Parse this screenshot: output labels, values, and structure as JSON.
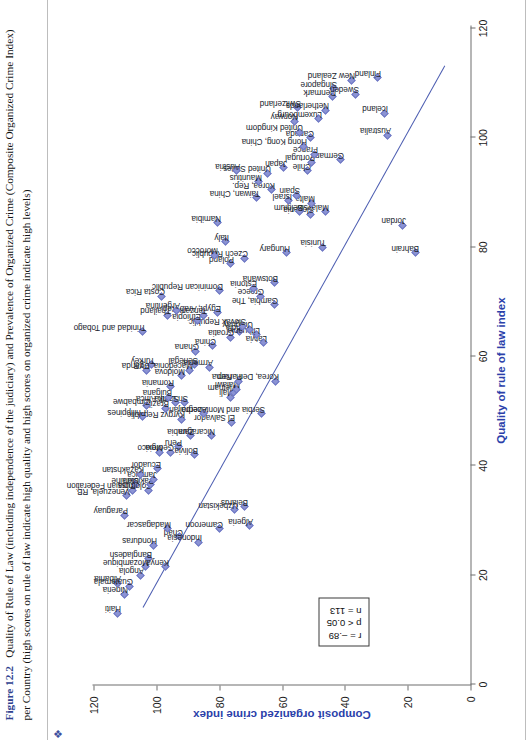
{
  "figure": {
    "bullet_icon": "diamond-bullet",
    "label": "Figure 12.2",
    "caption": "Quality of Rule of Law (including independence of the judiciary) and Prevalence of Organized Crime (Composite Organized Crime Index) per Country (high scores on rule of law indicate high quality and high scores on organized crime indicate high levels)"
  },
  "stats": {
    "r": "r = –.89",
    "p": "p < 0.05",
    "n": "n = 113"
  },
  "colors": {
    "accent_label": "#2e3f8f",
    "axis_title": "#2b3faa",
    "marker_fill": "#8b93d4",
    "marker_edge": "#6f78c4",
    "fit_line": "#4a5bb0",
    "axis_line": "#6f6f6f"
  },
  "chart_data": {
    "type": "scatter",
    "title": "Quality of Rule of Law (including independence of the judiciary) and Prevalence of Organized Crime (Composite Organized Crime Index) per Country",
    "xlabel": "Quality of rule of law index",
    "ylabel": "Composit organized crime index",
    "xlim": [
      0,
      120
    ],
    "ylim": [
      0,
      120
    ],
    "xticks": [
      0,
      20,
      40,
      60,
      80,
      100,
      120
    ],
    "yticks": [
      0,
      20,
      40,
      60,
      80,
      100,
      120
    ],
    "grid": false,
    "legend": "none",
    "annotations": [
      "r = –.89",
      "p < 0.05",
      "n = 113"
    ],
    "trendline": {
      "x0": 14,
      "y0": 104.5,
      "x1": 113,
      "y1": 8.5,
      "note": "negative linear fit"
    },
    "point_label_key": "country",
    "points": [
      {
        "country": "Haiti",
        "x": 13.0,
        "y": 112.5
      },
      {
        "country": "Nigeria",
        "x": 16.5,
        "y": 110.0
      },
      {
        "country": "Albania",
        "x": 18.5,
        "y": 112.5
      },
      {
        "country": "Guatemala",
        "x": 18.0,
        "y": 108.5
      },
      {
        "country": "Angola",
        "x": 20.0,
        "y": 105.0
      },
      {
        "country": "Mozambique",
        "x": 21.5,
        "y": 103.5
      },
      {
        "country": "Bangladesh",
        "x": 23.0,
        "y": 102.5
      },
      {
        "country": "Honduras",
        "x": 25.5,
        "y": 101.0
      },
      {
        "country": "Kenya",
        "x": 21.5,
        "y": 97.0
      },
      {
        "country": "Chad",
        "x": 27.0,
        "y": 92.5
      },
      {
        "country": "Madagascar",
        "x": 28.5,
        "y": 96.5
      },
      {
        "country": "Indonesia",
        "x": 26.0,
        "y": 86.5
      },
      {
        "country": "Cameroon",
        "x": 28.5,
        "y": 80.0
      },
      {
        "country": "Algeria",
        "x": 29.0,
        "y": 70.5
      },
      {
        "country": "Uzbekistan",
        "x": 32.0,
        "y": 75.0
      },
      {
        "country": "Belarus",
        "x": 32.5,
        "y": 72.0
      },
      {
        "country": "Paraguay",
        "x": 31.0,
        "y": 110.0
      },
      {
        "country": "Venezuela, RB",
        "x": 34.5,
        "y": 109.5
      },
      {
        "country": "Russian Federation",
        "x": 35.5,
        "y": 107.5
      },
      {
        "country": "Ukraine",
        "x": 36.5,
        "y": 106.5
      },
      {
        "country": "Colombia",
        "x": 35.5,
        "y": 102.5
      },
      {
        "country": "Pakistan",
        "x": 36.5,
        "y": 102.0
      },
      {
        "country": "Jamaica",
        "x": 37.5,
        "y": 101.0
      },
      {
        "country": "Kazakhstan",
        "x": 38.5,
        "y": 105.0
      },
      {
        "country": "Ecuador",
        "x": 39.5,
        "y": 99.5
      },
      {
        "country": "Mexico",
        "x": 42.5,
        "y": 99.0
      },
      {
        "country": "Georgia",
        "x": 42.5,
        "y": 95.5
      },
      {
        "country": "Peru",
        "x": 43.5,
        "y": 93.0
      },
      {
        "country": "Bolivia",
        "x": 42.0,
        "y": 88.0
      },
      {
        "country": "Zambia",
        "x": 45.5,
        "y": 89.0
      },
      {
        "country": "Nicaragua",
        "x": 45.5,
        "y": 82.5
      },
      {
        "country": "El Salvador",
        "x": 48.0,
        "y": 76.0
      },
      {
        "country": "Serbia and Montenegro",
        "x": 49.5,
        "y": 66.5
      },
      {
        "country": "Korea, Dem. Rep.",
        "x": 55.5,
        "y": 62.0
      },
      {
        "country": "Mali",
        "x": 52.5,
        "y": 76.5
      },
      {
        "country": "Vietnam",
        "x": 53.5,
        "y": 75.5
      },
      {
        "country": "Malawi",
        "x": 54.0,
        "y": 74.5
      },
      {
        "country": "Panama",
        "x": 55.5,
        "y": 74.0
      },
      {
        "country": "Kyrgyz Republic",
        "x": 48.5,
        "y": 92.0
      },
      {
        "country": "Azerbaijan",
        "x": 49.5,
        "y": 85.0
      },
      {
        "country": "Sri Lanka",
        "x": 51.5,
        "y": 91.0
      },
      {
        "country": "South Africa",
        "x": 51.5,
        "y": 94.0
      },
      {
        "country": "Brazil",
        "x": 50.5,
        "y": 97.0
      },
      {
        "country": "Bulgaria",
        "x": 52.5,
        "y": 96.0
      },
      {
        "country": "Romania",
        "x": 54.5,
        "y": 95.5
      },
      {
        "country": "Zimbabwe",
        "x": 51.0,
        "y": 103.0
      },
      {
        "country": "Philippines",
        "x": 49.0,
        "y": 104.5
      },
      {
        "country": "Uganda",
        "x": 57.5,
        "y": 103.0
      },
      {
        "country": "Turkey",
        "x": 58.5,
        "y": 101.5
      },
      {
        "country": "Moldova",
        "x": 56.5,
        "y": 92.0
      },
      {
        "country": "Macedonia, FYR",
        "x": 57.5,
        "y": 89.5
      },
      {
        "country": "Senegal",
        "x": 58.5,
        "y": 88.0
      },
      {
        "country": "Armenia",
        "x": 58.0,
        "y": 83.0
      },
      {
        "country": "Ghana",
        "x": 61.0,
        "y": 87.5
      },
      {
        "country": "China",
        "x": 62.0,
        "y": 82.0
      },
      {
        "country": "Croatia",
        "x": 63.5,
        "y": 76.5
      },
      {
        "country": "India",
        "x": 64.5,
        "y": 73.5
      },
      {
        "country": "Latvia",
        "x": 62.5,
        "y": 66.0
      },
      {
        "country": "Lithuania",
        "x": 64.0,
        "y": 68.0
      },
      {
        "country": "Uruguay",
        "x": 65.0,
        "y": 70.5
      },
      {
        "country": "Slovak Republic",
        "x": 65.5,
        "y": 72.5
      },
      {
        "country": "Ethiopia",
        "x": 66.5,
        "y": 87.0
      },
      {
        "country": "Tanzania",
        "x": 67.5,
        "y": 85.0
      },
      {
        "country": "Egypt, Arab Rep.",
        "x": 68.0,
        "y": 80.5
      },
      {
        "country": "Argentina",
        "x": 68.5,
        "y": 93.5
      },
      {
        "country": "Thailand",
        "x": 67.5,
        "y": 96.5
      },
      {
        "country": "Costa Rica",
        "x": 71.0,
        "y": 98.5
      },
      {
        "country": "Trinidad and Tobago",
        "x": 64.5,
        "y": 104.5
      },
      {
        "country": "Dominican Republic",
        "x": 72.0,
        "y": 80.0
      },
      {
        "country": "Gambia, The",
        "x": 69.5,
        "y": 62.5
      },
      {
        "country": "Greece",
        "x": 71.0,
        "y": 67.0
      },
      {
        "country": "Estonia",
        "x": 72.5,
        "y": 69.0
      },
      {
        "country": "Botswana",
        "x": 73.5,
        "y": 62.5
      },
      {
        "country": "Poland",
        "x": 77.0,
        "y": 76.5
      },
      {
        "country": "Czech Republic",
        "x": 78.0,
        "y": 72.0
      },
      {
        "country": "Morocco",
        "x": 78.5,
        "y": 81.5
      },
      {
        "country": "Italy",
        "x": 81.0,
        "y": 78.0
      },
      {
        "country": "Namibia",
        "x": 84.5,
        "y": 80.5
      },
      {
        "country": "Hungary",
        "x": 79.0,
        "y": 58.5
      },
      {
        "country": "Tunisia",
        "x": 80.0,
        "y": 47.0
      },
      {
        "country": "Bahrain",
        "x": 79.0,
        "y": 17.5
      },
      {
        "country": "Jordan",
        "x": 84.0,
        "y": 21.5
      },
      {
        "country": "Malaysia",
        "x": 86.5,
        "y": 46.0
      },
      {
        "country": "Slovenia",
        "x": 86.0,
        "y": 51.0
      },
      {
        "country": "Belgium",
        "x": 86.5,
        "y": 54.5
      },
      {
        "country": "Malta",
        "x": 88.0,
        "y": 50.5
      },
      {
        "country": "Israel",
        "x": 88.5,
        "y": 58.0
      },
      {
        "country": "Spain",
        "x": 89.5,
        "y": 55.5
      },
      {
        "country": "Taiwan, China",
        "x": 89.0,
        "y": 68.0
      },
      {
        "country": "Korea, Rep.",
        "x": 90.5,
        "y": 63.5
      },
      {
        "country": "Mauritius",
        "x": 92.0,
        "y": 67.5
      },
      {
        "country": "United States",
        "x": 93.5,
        "y": 64.5
      },
      {
        "country": "Japan",
        "x": 94.5,
        "y": 59.5
      },
      {
        "country": "Austria",
        "x": 94.0,
        "y": 74.5
      },
      {
        "country": "Germany",
        "x": 96.0,
        "y": 41.5
      },
      {
        "country": "Chile",
        "x": 94.0,
        "y": 52.0
      },
      {
        "country": "Portugal",
        "x": 95.5,
        "y": 50.5
      },
      {
        "country": "France",
        "x": 97.0,
        "y": 49.5
      },
      {
        "country": "Hong Kong, China",
        "x": 98.5,
        "y": 53.0
      },
      {
        "country": "Canada",
        "x": 100.0,
        "y": 51.0
      },
      {
        "country": "United Kingdom",
        "x": 101.0,
        "y": 54.5
      },
      {
        "country": "Norway",
        "x": 103.0,
        "y": 56.0
      },
      {
        "country": "Luxembourg",
        "x": 103.5,
        "y": 48.5
      },
      {
        "country": "Switzerland",
        "x": 105.5,
        "y": 55.0
      },
      {
        "country": "Netherlands",
        "x": 105.0,
        "y": 46.0
      },
      {
        "country": "Denmark",
        "x": 107.5,
        "y": 44.0
      },
      {
        "country": "Singapore",
        "x": 109.0,
        "y": 43.5
      },
      {
        "country": "Sweden",
        "x": 108.0,
        "y": 36.5
      },
      {
        "country": "New Zealand",
        "x": 110.5,
        "y": 38.0
      },
      {
        "country": "Australia",
        "x": 100.5,
        "y": 26.5
      },
      {
        "country": "Iceland",
        "x": 104.5,
        "y": 27.5
      },
      {
        "country": "Finland",
        "x": 111.0,
        "y": 29.5
      }
    ]
  }
}
